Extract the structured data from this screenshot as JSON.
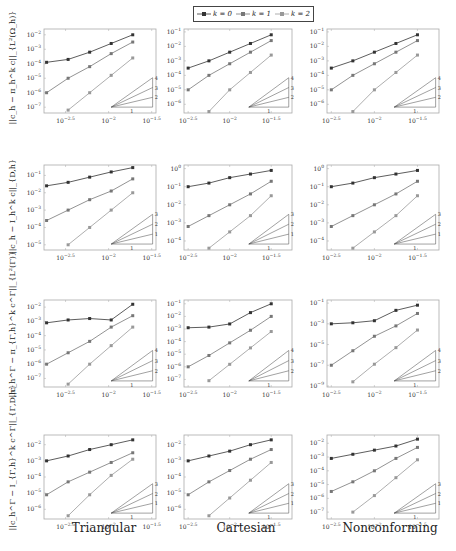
{
  "legend": {
    "entries": [
      {
        "label": "k = 0",
        "color": "#333333"
      },
      {
        "label": "k = 1",
        "color": "#777777"
      },
      {
        "label": "k = 2",
        "color": "#999999"
      }
    ]
  },
  "columns": [
    "Triangular",
    "Cartesian",
    "Nonconforming"
  ],
  "rows": [
    {
      "ylabel": "||c_h − π_h^k c||_{L²(Ω_h)}"
    },
    {
      "ylabel": "||c_h − I_h^k c||_{D,h}"
    },
    {
      "ylabel": "||c_h^Γ − π_{Γ,h}^k c^Γ||_{L²(Γ)}"
    },
    {
      "ylabel": "||c_h^Γ − I_{Γ,h}^k c^Γ||_{Γ,D,h}"
    }
  ],
  "chart_data": [
    {
      "type": "line",
      "row": 0,
      "col": "Triangular",
      "xscale": "log",
      "yscale": "log",
      "xticks": [
        "10^-2.5",
        "10^-2",
        "10^-1.5"
      ],
      "yticks": [
        "10^-2",
        "10^-3",
        "10^-4",
        "10^-5",
        "10^-6",
        "10^-7"
      ],
      "xlim": [
        -2.75,
        -1.45
      ],
      "ylim": [
        -7.4,
        -1.6
      ],
      "x": [
        -2.72,
        -2.47,
        -2.22,
        -1.97,
        -1.72
      ],
      "series": [
        {
          "name": "k = 0",
          "logy": [
            -3.9,
            -3.7,
            -3.2,
            -2.6,
            -2.0
          ]
        },
        {
          "name": "k = 1",
          "logy": [
            -6.0,
            -5.0,
            -4.2,
            -3.3,
            -2.5
          ]
        },
        {
          "name": "k = 2",
          "logy": [
            null,
            -7.2,
            -6.0,
            -4.8,
            -3.6
          ]
        }
      ],
      "slope_triangle": {
        "labels": [
          "4",
          "3",
          "2"
        ],
        "base": "1"
      }
    },
    {
      "type": "line",
      "row": 0,
      "col": "Cartesian",
      "xscale": "log",
      "yscale": "log",
      "xticks": [
        "10^-2.5",
        "10^-2",
        "10^-1.5"
      ],
      "yticks": [
        "10^-1",
        "10^-2",
        "10^-3",
        "10^-4",
        "10^-5",
        "10^-6"
      ],
      "xlim": [
        -2.55,
        -1.25
      ],
      "ylim": [
        -6.6,
        -0.8
      ],
      "x": [
        -2.5,
        -2.25,
        -2.0,
        -1.75,
        -1.5
      ],
      "series": [
        {
          "name": "k = 0",
          "logy": [
            -3.5,
            -3.0,
            -2.4,
            -1.8,
            -1.2
          ]
        },
        {
          "name": "k = 1",
          "logy": [
            -5.0,
            -4.0,
            -3.2,
            -2.4,
            -1.6
          ]
        },
        {
          "name": "k = 2",
          "logy": [
            null,
            -6.5,
            -5.0,
            -3.8,
            -2.6
          ]
        }
      ],
      "slope_triangle": {
        "labels": [
          "4",
          "3",
          "2"
        ],
        "base": "1"
      }
    },
    {
      "type": "line",
      "row": 0,
      "col": "Nonconforming",
      "xscale": "log",
      "yscale": "log",
      "xticks": [
        "10^-2.5",
        "10^-2",
        "10^-1.5"
      ],
      "yticks": [
        "10^-1",
        "10^-2",
        "10^-3",
        "10^-4",
        "10^-5",
        "10^-6"
      ],
      "xlim": [
        -2.55,
        -1.25
      ],
      "ylim": [
        -6.6,
        -0.8
      ],
      "x": [
        -2.5,
        -2.25,
        -2.0,
        -1.75,
        -1.5
      ],
      "series": [
        {
          "name": "k = 0",
          "logy": [
            -3.5,
            -3.0,
            -2.4,
            -1.8,
            -1.2
          ]
        },
        {
          "name": "k = 1",
          "logy": [
            -5.0,
            -4.0,
            -3.2,
            -2.4,
            -1.6
          ]
        },
        {
          "name": "k = 2",
          "logy": [
            null,
            -6.5,
            -5.0,
            -3.8,
            -2.6
          ]
        }
      ],
      "slope_triangle": {
        "labels": [
          "4",
          "3",
          "2"
        ],
        "base": "1"
      }
    },
    {
      "type": "line",
      "row": 1,
      "col": "Triangular",
      "xscale": "log",
      "yscale": "log",
      "xticks": [
        "10^-2.5",
        "10^-2",
        "10^-1.5"
      ],
      "yticks": [
        "10^-1",
        "10^-2",
        "10^-3",
        "10^-4",
        "10^-5"
      ],
      "xlim": [
        -2.75,
        -1.45
      ],
      "ylim": [
        -5.3,
        -0.4
      ],
      "x": [
        -2.72,
        -2.47,
        -2.22,
        -1.97,
        -1.72
      ],
      "series": [
        {
          "name": "k = 0",
          "logy": [
            -1.6,
            -1.4,
            -1.1,
            -0.8,
            -0.55
          ]
        },
        {
          "name": "k = 1",
          "logy": [
            -3.6,
            -3.0,
            -2.4,
            -1.9,
            -1.2
          ]
        },
        {
          "name": "k = 2",
          "logy": [
            null,
            -5.0,
            -4.0,
            -3.0,
            -2.0
          ]
        }
      ],
      "slope_triangle": {
        "labels": [
          "3",
          "2",
          "1"
        ],
        "base": "1"
      }
    },
    {
      "type": "line",
      "row": 1,
      "col": "Cartesian",
      "xscale": "log",
      "yscale": "log",
      "xticks": [
        "10^-2.5",
        "10^-2",
        "10^-1.5"
      ],
      "yticks": [
        "10^0",
        "10^-1",
        "10^-2",
        "10^-3",
        "10^-4"
      ],
      "xlim": [
        -2.55,
        -1.25
      ],
      "ylim": [
        -4.5,
        0.2
      ],
      "x": [
        -2.5,
        -2.25,
        -2.0,
        -1.75,
        -1.5
      ],
      "series": [
        {
          "name": "k = 0",
          "logy": [
            -1.0,
            -0.8,
            -0.5,
            -0.3,
            -0.1
          ]
        },
        {
          "name": "k = 1",
          "logy": [
            -3.2,
            -2.6,
            -2.0,
            -1.4,
            -0.7
          ]
        },
        {
          "name": "k = 2",
          "logy": [
            null,
            -4.4,
            -3.5,
            -2.6,
            -1.5
          ]
        }
      ],
      "slope_triangle": {
        "labels": [
          "3",
          "2",
          "1"
        ],
        "base": "1"
      }
    },
    {
      "type": "line",
      "row": 1,
      "col": "Nonconforming",
      "xscale": "log",
      "yscale": "log",
      "xticks": [
        "10^-2.5",
        "10^-2",
        "10^-1.5"
      ],
      "yticks": [
        "10^0",
        "10^-1",
        "10^-2",
        "10^-3",
        "10^-4"
      ],
      "xlim": [
        -2.55,
        -1.25
      ],
      "ylim": [
        -4.5,
        0.2
      ],
      "x": [
        -2.5,
        -2.25,
        -2.0,
        -1.75,
        -1.5
      ],
      "series": [
        {
          "name": "k = 0",
          "logy": [
            -1.0,
            -0.8,
            -0.5,
            -0.3,
            -0.1
          ]
        },
        {
          "name": "k = 1",
          "logy": [
            -3.2,
            -2.6,
            -2.0,
            -1.4,
            -0.7
          ]
        },
        {
          "name": "k = 2",
          "logy": [
            null,
            -4.4,
            -3.5,
            -2.6,
            -1.5
          ]
        }
      ],
      "slope_triangle": {
        "labels": [
          "3",
          "2",
          "1"
        ],
        "base": "1"
      }
    },
    {
      "type": "line",
      "row": 2,
      "col": "Triangular",
      "xscale": "log",
      "yscale": "log",
      "xticks": [
        "10^-2.5",
        "10^-2",
        "10^-1.5"
      ],
      "yticks": [
        "10^-2",
        "10^-3",
        "10^-4",
        "10^-5",
        "10^-6",
        "10^-7"
      ],
      "xlim": [
        -2.75,
        -1.45
      ],
      "ylim": [
        -7.6,
        -1.5
      ],
      "x": [
        -2.72,
        -2.47,
        -2.22,
        -1.97,
        -1.72
      ],
      "series": [
        {
          "name": "k = 0",
          "logy": [
            -3.1,
            -2.9,
            -2.8,
            -2.9,
            -1.8
          ]
        },
        {
          "name": "k = 1",
          "logy": [
            -6.0,
            -5.2,
            -4.4,
            -3.4,
            -2.6
          ]
        },
        {
          "name": "k = 2",
          "logy": [
            null,
            -7.4,
            -6.0,
            -4.7,
            -3.4
          ]
        }
      ],
      "slope_triangle": {
        "labels": [
          "4",
          "3",
          "2"
        ],
        "base": "1"
      }
    },
    {
      "type": "line",
      "row": 2,
      "col": "Cartesian",
      "xscale": "log",
      "yscale": "log",
      "xticks": [
        "10^-2.5",
        "10^-2",
        "10^-1.5"
      ],
      "yticks": [
        "10^-1",
        "10^-2",
        "10^-3",
        "10^-4",
        "10^-5",
        "10^-6",
        "10^-7"
      ],
      "xlim": [
        -2.55,
        -1.25
      ],
      "ylim": [
        -7.6,
        -0.7
      ],
      "x": [
        -2.5,
        -2.25,
        -2.0,
        -1.75,
        -1.5
      ],
      "series": [
        {
          "name": "k = 0",
          "logy": [
            -2.9,
            -2.85,
            -2.6,
            -1.7,
            -1.0
          ]
        },
        {
          "name": "k = 1",
          "logy": [
            -6.0,
            -5.1,
            -4.1,
            -3.1,
            -2.0
          ]
        },
        {
          "name": "k = 2",
          "logy": [
            null,
            -7.1,
            -5.8,
            -4.5,
            -3.2
          ]
        }
      ],
      "slope_triangle": {
        "labels": [
          "4",
          "3",
          "2"
        ],
        "base": "1"
      }
    },
    {
      "type": "line",
      "row": 2,
      "col": "Nonconforming",
      "xscale": "log",
      "yscale": "log",
      "xticks": [
        "10^-2.5",
        "10^-2",
        "10^-1.5"
      ],
      "yticks": [
        "10^-1",
        "10^-3",
        "10^-5",
        "10^-7",
        "10^-9"
      ],
      "xlim": [
        -2.55,
        -1.25
      ],
      "ylim": [
        -9.1,
        -0.7
      ],
      "x": [
        -2.5,
        -2.25,
        -2.0,
        -1.75,
        -1.5
      ],
      "series": [
        {
          "name": "k = 0",
          "logy": [
            -3.0,
            -2.9,
            -2.7,
            -1.7,
            -1.2
          ]
        },
        {
          "name": "k = 1",
          "logy": [
            -7.0,
            -5.6,
            -4.2,
            -3.2,
            -2.0
          ]
        },
        {
          "name": "k = 2",
          "logy": [
            null,
            -8.6,
            -6.9,
            -5.3,
            -3.6
          ]
        }
      ],
      "slope_triangle": {
        "labels": [
          "4",
          "3",
          "2"
        ],
        "base": "1"
      }
    },
    {
      "type": "line",
      "row": 3,
      "col": "Triangular",
      "xscale": "log",
      "yscale": "log",
      "xticks": [
        "10^-2.5",
        "10^-2",
        "10^-1.5"
      ],
      "yticks": [
        "10^-2",
        "10^-3",
        "10^-4",
        "10^-5",
        "10^-6"
      ],
      "xlim": [
        -2.75,
        -1.45
      ],
      "ylim": [
        -6.6,
        -1.4
      ],
      "x": [
        -2.72,
        -2.47,
        -2.22,
        -1.97,
        -1.72
      ],
      "series": [
        {
          "name": "k = 0",
          "logy": [
            -3.0,
            -2.7,
            -2.3,
            -2.0,
            -1.7
          ]
        },
        {
          "name": "k = 1",
          "logy": [
            -5.1,
            -4.3,
            -3.7,
            -3.1,
            -2.5
          ]
        },
        {
          "name": "k = 2",
          "logy": [
            null,
            -6.4,
            -5.1,
            -3.9,
            -2.9
          ]
        }
      ],
      "slope_triangle": {
        "labels": [
          "3",
          "2",
          "1"
        ],
        "base": "1"
      }
    },
    {
      "type": "line",
      "row": 3,
      "col": "Cartesian",
      "xscale": "log",
      "yscale": "log",
      "xticks": [
        "10^-2.5",
        "10^-2",
        "10^-1.5"
      ],
      "yticks": [
        "10^-2",
        "10^-3",
        "10^-4",
        "10^-5",
        "10^-6"
      ],
      "xlim": [
        -2.55,
        -1.25
      ],
      "ylim": [
        -6.6,
        -1.4
      ],
      "x": [
        -2.5,
        -2.25,
        -2.0,
        -1.75,
        -1.5
      ],
      "series": [
        {
          "name": "k = 0",
          "logy": [
            -3.0,
            -2.7,
            -2.4,
            -2.0,
            -1.7
          ]
        },
        {
          "name": "k = 1",
          "logy": [
            -5.1,
            -4.3,
            -3.6,
            -2.9,
            -2.3
          ]
        },
        {
          "name": "k = 2",
          "logy": [
            null,
            -6.4,
            -5.3,
            -4.2,
            -3.1
          ]
        }
      ],
      "slope_triangle": {
        "labels": [
          "3",
          "2",
          "1"
        ],
        "base": "1"
      }
    },
    {
      "type": "line",
      "row": 3,
      "col": "Nonconforming",
      "xscale": "log",
      "yscale": "log",
      "xticks": [
        "10^-2.5",
        "10^-2",
        "10^-1.5"
      ],
      "yticks": [
        "10^-2",
        "10^-3",
        "10^-4",
        "10^-5",
        "10^-6",
        "10^-7"
      ],
      "xlim": [
        -2.55,
        -1.25
      ],
      "ylim": [
        -7.5,
        -1.4
      ],
      "x": [
        -2.5,
        -2.25,
        -2.0,
        -1.75,
        -1.5
      ],
      "series": [
        {
          "name": "k = 0",
          "logy": [
            -3.1,
            -2.8,
            -2.5,
            -2.2,
            -1.7
          ]
        },
        {
          "name": "k = 1",
          "logy": [
            -5.5,
            -4.8,
            -4.0,
            -3.1,
            -2.3
          ]
        },
        {
          "name": "k = 2",
          "logy": [
            null,
            -7.0,
            -5.8,
            -4.5,
            -3.2
          ]
        }
      ],
      "slope_triangle": {
        "labels": [
          "3",
          "2",
          "1"
        ],
        "base": "1"
      }
    }
  ]
}
